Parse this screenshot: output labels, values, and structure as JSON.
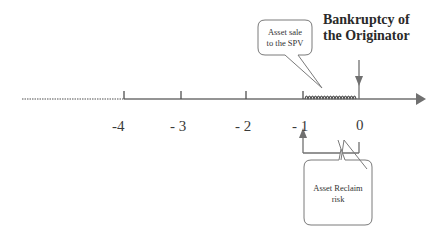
{
  "diagram": {
    "type": "timeline",
    "title_line1": "Bankruptcy of",
    "title_line2": "the Originator",
    "ticks": [
      {
        "label": "-4"
      },
      {
        "label": "- 3"
      },
      {
        "label": "- 2"
      },
      {
        "label": "- 1"
      },
      {
        "label": "0"
      }
    ],
    "callouts": {
      "asset_sale": {
        "line1": "Asset sale",
        "line2": "to the SPV"
      },
      "reclaim": {
        "line1": "Asset Reclaim",
        "line2": "risk"
      }
    },
    "colors": {
      "line": "#707070",
      "text": "#333333"
    }
  }
}
